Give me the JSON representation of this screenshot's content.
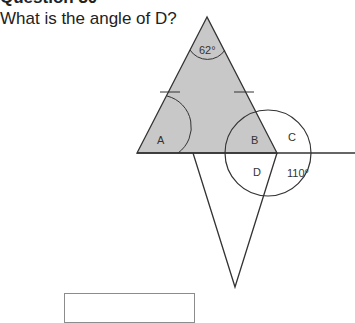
{
  "question": {
    "title": "Question 30",
    "text": "What is the angle of D?"
  },
  "diagram": {
    "apex_angle": "62°",
    "labels": {
      "a": "A",
      "b": "B",
      "c": "C",
      "d": "D"
    },
    "known_angle": "110°",
    "fill_color": "#c8c8c8",
    "stroke_color": "#333333"
  },
  "answer": {
    "value": ""
  }
}
